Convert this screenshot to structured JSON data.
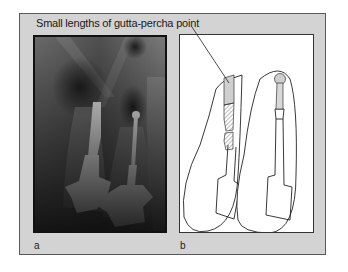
{
  "figure": {
    "caption": "Small lengths of gutta-percha point",
    "panels": [
      {
        "label": "a",
        "description": "radiograph"
      },
      {
        "label": "b",
        "description": "line diagram"
      }
    ],
    "colors": {
      "frame_background": "#d3d3d3",
      "frame_border": "#5a5a5a",
      "diagram_background": "#ffffff"
    }
  }
}
